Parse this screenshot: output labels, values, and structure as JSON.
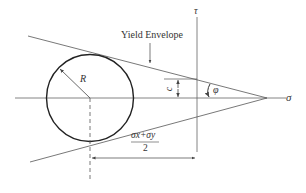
{
  "diagram": {
    "labels": {
      "yield_envelope": "Yield Envelope",
      "tau_axis": "τ",
      "sigma_axis": "σ",
      "radius": "R",
      "cohesion": "c",
      "friction_angle": "φ",
      "center_numerator": "σx+σy",
      "center_denominator": "2"
    },
    "colors": {
      "line": "#555555",
      "circle": "#222222",
      "text": "#333333",
      "background": "#ffffff"
    }
  }
}
